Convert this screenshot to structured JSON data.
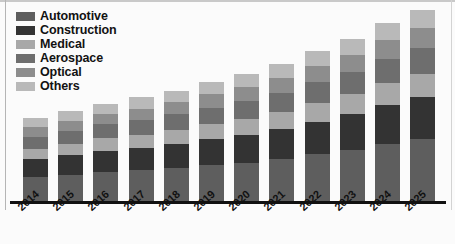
{
  "chart_data": {
    "type": "bar",
    "subtype": "stacked-bar",
    "title": "",
    "xlabel": "",
    "ylabel": "",
    "grid": false,
    "legend_position": "top-left",
    "categories": [
      "2014",
      "2015",
      "2016",
      "2017",
      "2018",
      "2019",
      "2020",
      "2021",
      "2022",
      "2023",
      "2024",
      "2025"
    ],
    "series": [
      {
        "name": "Automotive",
        "color": "#5e5e5e",
        "values": [
          26,
          28,
          31,
          33,
          35,
          38,
          41,
          45,
          50,
          55,
          61,
          66
        ]
      },
      {
        "name": "Construction",
        "color": "#333333",
        "values": [
          19,
          21,
          23,
          24,
          26,
          28,
          30,
          32,
          35,
          38,
          42,
          45
        ]
      },
      {
        "name": "Medical",
        "color": "#a8a8a8",
        "values": [
          11,
          12,
          13,
          14,
          15,
          16,
          17,
          18,
          20,
          21,
          23,
          25
        ]
      },
      {
        "name": "Aerospace",
        "color": "#6e6e6e",
        "values": [
          13,
          14,
          15,
          16,
          17,
          18,
          19,
          21,
          22,
          24,
          26,
          28
        ]
      },
      {
        "name": "Optical",
        "color": "#8d8d8d",
        "values": [
          10,
          11,
          11,
          12,
          13,
          14,
          15,
          16,
          17,
          18,
          20,
          21
        ]
      },
      {
        "name": "Others",
        "color": "#b9b9b9",
        "values": [
          10,
          10,
          11,
          12,
          12,
          13,
          14,
          15,
          16,
          17,
          18,
          19
        ]
      }
    ],
    "totals": [
      89,
      96,
      104,
      111,
      118,
      127,
      136,
      147,
      160,
      173,
      190,
      204
    ],
    "ylim": [
      0,
      215
    ]
  },
  "legend": {
    "items": [
      {
        "label": "Automotive",
        "color": "#5e5e5e"
      },
      {
        "label": "Construction",
        "color": "#333333"
      },
      {
        "label": "Medical",
        "color": "#a8a8a8"
      },
      {
        "label": "Aerospace",
        "color": "#6e6e6e"
      },
      {
        "label": "Optical",
        "color": "#8d8d8d"
      },
      {
        "label": "Others",
        "color": "#b9b9b9"
      }
    ]
  },
  "axis": {
    "baseline_color": "#111111"
  }
}
